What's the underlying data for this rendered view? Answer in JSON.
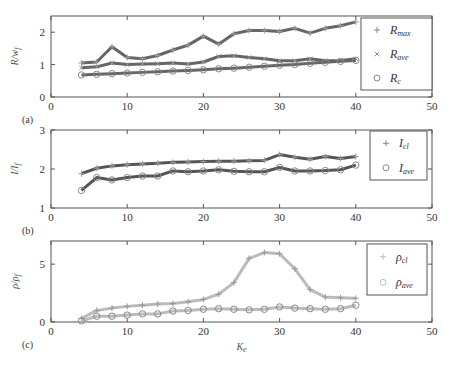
{
  "chart_data": [
    {
      "type": "line",
      "panel_label": "(a)",
      "ylabel": "R/w_f",
      "ylabel_main": "R/w",
      "ylabel_sub": "f",
      "xlabel": "",
      "xlim": [
        0,
        50
      ],
      "ylim": [
        0,
        2.5
      ],
      "xticks": [
        0,
        10,
        20,
        30,
        40,
        50
      ],
      "yticks": [
        0,
        1,
        2
      ],
      "legend_position": "upper right (outside data, inside axes)",
      "x": [
        4,
        6,
        8,
        10,
        12,
        14,
        16,
        18,
        20,
        22,
        24,
        26,
        28,
        30,
        32,
        34,
        36,
        38,
        40
      ],
      "series": [
        {
          "name": "R_max",
          "label_main": "R",
          "label_sub": "max",
          "marker": "plus",
          "color": "#666666",
          "values": [
            1.05,
            1.08,
            1.55,
            1.22,
            1.18,
            1.28,
            1.45,
            1.6,
            1.88,
            1.63,
            1.95,
            2.05,
            2.05,
            2.02,
            2.12,
            1.97,
            2.12,
            2.2,
            2.32
          ]
        },
        {
          "name": "R_ave",
          "label_main": "R",
          "label_sub": "ave",
          "marker": "x",
          "color": "#666666",
          "values": [
            0.9,
            0.93,
            1.05,
            1.0,
            1.02,
            1.03,
            1.05,
            1.02,
            1.08,
            1.25,
            1.27,
            1.22,
            1.18,
            1.12,
            1.12,
            1.18,
            1.12,
            1.13,
            1.18
          ]
        },
        {
          "name": "R_c",
          "label_main": "R",
          "label_sub": "c",
          "marker": "circle",
          "color": "#666666",
          "values": [
            0.68,
            0.7,
            0.72,
            0.74,
            0.76,
            0.78,
            0.8,
            0.82,
            0.84,
            0.87,
            0.89,
            0.92,
            0.95,
            0.98,
            1.0,
            1.04,
            1.07,
            1.1,
            1.13
          ]
        }
      ]
    },
    {
      "type": "line",
      "panel_label": "(b)",
      "ylabel": "I/I_f",
      "ylabel_main": "I/I",
      "ylabel_sub": "f",
      "xlabel": "",
      "xlim": [
        0,
        50
      ],
      "ylim": [
        1,
        3
      ],
      "xticks": [
        0,
        10,
        20,
        30,
        40,
        50
      ],
      "yticks": [
        1,
        2,
        3
      ],
      "legend_position": "upper right",
      "x": [
        4,
        6,
        8,
        10,
        12,
        14,
        16,
        18,
        20,
        22,
        24,
        26,
        28,
        30,
        32,
        34,
        36,
        38,
        40
      ],
      "series": [
        {
          "name": "I_cl",
          "label_main": "I",
          "label_sub": "cl",
          "marker": "plus",
          "color": "#555555",
          "values": [
            1.88,
            2.02,
            2.08,
            2.11,
            2.13,
            2.15,
            2.17,
            2.18,
            2.19,
            2.2,
            2.2,
            2.21,
            2.22,
            2.37,
            2.3,
            2.25,
            2.32,
            2.27,
            2.32
          ]
        },
        {
          "name": "I_ave",
          "label_main": "I",
          "label_sub": "ave",
          "marker": "circle",
          "color": "#555555",
          "values": [
            1.45,
            1.78,
            1.72,
            1.78,
            1.82,
            1.82,
            1.95,
            1.93,
            1.95,
            1.98,
            1.94,
            1.93,
            1.93,
            2.04,
            1.95,
            1.95,
            1.96,
            1.98,
            2.1
          ]
        }
      ]
    },
    {
      "type": "line",
      "panel_label": "(c)",
      "ylabel": "ρ/ρ_f",
      "ylabel_main": "ρ/ρ",
      "ylabel_sub": "f",
      "xlabel": "K_e",
      "xlabel_main": "K",
      "xlabel_sub": "e",
      "xlim": [
        0,
        50
      ],
      "ylim": [
        0,
        7
      ],
      "xticks": [
        0,
        10,
        20,
        30,
        40,
        50
      ],
      "yticks": [
        0,
        5
      ],
      "legend_position": "upper right",
      "x": [
        4,
        6,
        8,
        10,
        12,
        14,
        16,
        18,
        20,
        22,
        24,
        26,
        28,
        30,
        32,
        34,
        36,
        38,
        40
      ],
      "series": [
        {
          "name": "ρ_cl",
          "label_main": "ρ",
          "label_sub": "cl",
          "marker": "plus",
          "color": "#bbbbbb",
          "values": [
            0.3,
            1.0,
            1.2,
            1.35,
            1.45,
            1.55,
            1.6,
            1.75,
            1.95,
            2.4,
            3.4,
            5.5,
            6.0,
            5.9,
            4.6,
            2.8,
            2.15,
            2.1,
            2.05
          ]
        },
        {
          "name": "ρ_ave",
          "label_main": "ρ",
          "label_sub": "ave",
          "marker": "circle",
          "color": "#bbbbbb",
          "values": [
            0.1,
            0.5,
            0.5,
            0.6,
            0.7,
            0.7,
            0.95,
            1.0,
            1.1,
            1.15,
            1.1,
            1.05,
            1.1,
            1.3,
            1.2,
            1.15,
            1.1,
            1.15,
            1.45
          ]
        }
      ]
    }
  ],
  "layout": {
    "panels": [
      {
        "left": 51,
        "right": 432,
        "top": 16,
        "bottom": 97,
        "legend": {
          "x": 361,
          "y": 18,
          "w": 71,
          "h": 72
        }
      },
      {
        "left": 51,
        "right": 432,
        "top": 130,
        "bottom": 208,
        "legend": {
          "x": 370,
          "y": 131,
          "w": 57,
          "h": 49
        }
      },
      {
        "left": 51,
        "right": 432,
        "top": 241,
        "bottom": 322,
        "legend": {
          "x": 367,
          "y": 244,
          "w": 60,
          "h": 51
        }
      }
    ]
  }
}
